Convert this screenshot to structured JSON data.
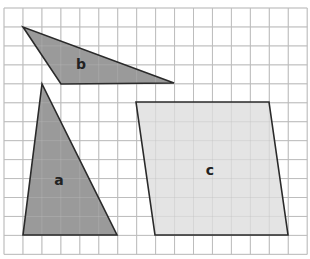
{
  "grid": {
    "origin_x": 4,
    "origin_y": 8,
    "cell": 18.95,
    "cols": 16,
    "rows": 13,
    "line_color": "#bdbdbd",
    "border_color": "#cfcfcf"
  },
  "shapes": [
    {
      "id": "b",
      "label": "b",
      "type": "triangle",
      "points": "23,27 61,84 174,83",
      "fill": "#9a9a9a",
      "label_pos": [
        81,
        69
      ]
    },
    {
      "id": "a",
      "label": "a",
      "type": "triangle",
      "points": "42,84 23,235 117,235",
      "fill": "#9a9a9a",
      "label_pos": [
        59,
        185
      ]
    },
    {
      "id": "c",
      "label": "c",
      "type": "parallelogram",
      "points": "136,102 269,102 288,235 155,235",
      "fill": "#e4e4e4",
      "label_pos": [
        210,
        175
      ]
    }
  ],
  "stroke_color": "#2a2a2a"
}
